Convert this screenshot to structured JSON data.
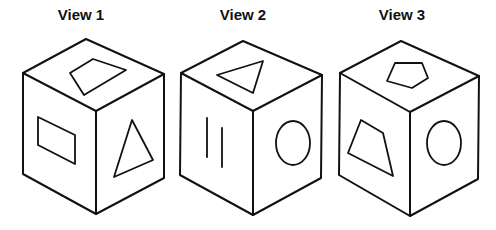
{
  "views": [
    {
      "title": "View 1",
      "faces": {
        "top": "quadrilateral",
        "left": "rectangle",
        "right": "triangle"
      }
    },
    {
      "title": "View 2",
      "faces": {
        "top": "triangle",
        "left": "two vertical lines",
        "right": "circle"
      }
    },
    {
      "title": "View 3",
      "faces": {
        "top": "pentagon",
        "left": "trapezoid",
        "right": "circle"
      }
    }
  ],
  "colors": {
    "stroke": "#111111",
    "background": "#ffffff"
  }
}
